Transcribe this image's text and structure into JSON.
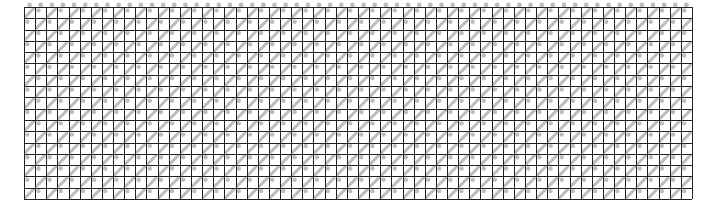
{
  "figure": {
    "grid": {
      "left": 24,
      "top": 7,
      "right": 692,
      "bottom": 199,
      "columns": 60,
      "rows": 17,
      "line_color": "#222222",
      "fill_color": "#bdbdbd",
      "background": "#ffffff"
    }
  }
}
